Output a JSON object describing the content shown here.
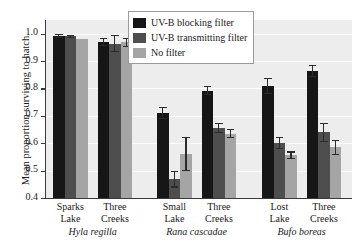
{
  "chart_data": {
    "type": "bar",
    "title": "",
    "xlabel": "",
    "ylabel": "Mean proportion surviving to hatch",
    "ylim": [
      0.4,
      1.05
    ],
    "yticks": [
      0.4,
      0.5,
      0.6,
      0.7,
      0.8,
      0.9,
      1.0
    ],
    "ytick_labels": [
      "0.4",
      "0.5",
      "0.6",
      "0.7",
      "0.8",
      "0.9",
      "1.0"
    ],
    "grid": true,
    "legend_position": "top-center",
    "categories": [
      "Sparks Lake",
      "Three Creeks",
      "Small Lake",
      "Three Creeks",
      "Lost Lake",
      "Three Creeks"
    ],
    "groups": [
      {
        "species": "Hyla regilla",
        "sites": [
          {
            "site_line1": "Sparks",
            "site_line2": "Lake",
            "bars": [
              {
                "series": "UV-B blocking filter",
                "value": 0.992,
                "err_low": 0.008,
                "err_high": 0.008
              },
              {
                "series": "UV-B transmitting filter",
                "value": 0.991,
                "err_low": 0.006,
                "err_high": 0.006
              },
              {
                "series": "No filter",
                "value": 0.982,
                "err_low": 0.0,
                "err_high": 0.0
              }
            ]
          },
          {
            "site_line1": "Three",
            "site_line2": "Creeks",
            "bars": [
              {
                "series": "UV-B blocking filter",
                "value": 0.97,
                "err_low": 0.014,
                "err_high": 0.014
              },
              {
                "series": "UV-B transmitting filter",
                "value": 0.964,
                "err_low": 0.03,
                "err_high": 0.03
              },
              {
                "series": "No filter",
                "value": 0.968,
                "err_low": 0.016,
                "err_high": 0.016
              }
            ]
          }
        ]
      },
      {
        "species": "Rana cascadae",
        "sites": [
          {
            "site_line1": "Small",
            "site_line2": "Lake",
            "bars": [
              {
                "series": "UV-B blocking filter",
                "value": 0.71,
                "err_low": 0.022,
                "err_high": 0.022
              },
              {
                "series": "UV-B transmitting filter",
                "value": 0.468,
                "err_low": 0.03,
                "err_high": 0.03
              },
              {
                "series": "No filter",
                "value": 0.56,
                "err_low": 0.062,
                "err_high": 0.062
              }
            ]
          },
          {
            "site_line1": "Three",
            "site_line2": "Creeks",
            "bars": [
              {
                "series": "UV-B blocking filter",
                "value": 0.792,
                "err_low": 0.016,
                "err_high": 0.016
              },
              {
                "series": "UV-B transmitting filter",
                "value": 0.656,
                "err_low": 0.018,
                "err_high": 0.018
              },
              {
                "series": "No filter",
                "value": 0.635,
                "err_low": 0.016,
                "err_high": 0.016
              }
            ]
          }
        ]
      },
      {
        "species": "Bufo boreas",
        "sites": [
          {
            "site_line1": "Lost",
            "site_line2": "Lake",
            "bars": [
              {
                "series": "UV-B blocking filter",
                "value": 0.81,
                "err_low": 0.03,
                "err_high": 0.03
              },
              {
                "series": "UV-B transmitting filter",
                "value": 0.6,
                "err_low": 0.022,
                "err_high": 0.022
              },
              {
                "series": "No filter",
                "value": 0.556,
                "err_low": 0.014,
                "err_high": 0.014
              }
            ]
          },
          {
            "site_line1": "Three",
            "site_line2": "Creeks",
            "bars": [
              {
                "series": "UV-B blocking filter",
                "value": 0.864,
                "err_low": 0.022,
                "err_high": 0.022
              },
              {
                "series": "UV-B transmitting filter",
                "value": 0.64,
                "err_low": 0.035,
                "err_high": 0.035
              },
              {
                "series": "No filter",
                "value": 0.585,
                "err_low": 0.028,
                "err_high": 0.028
              }
            ]
          }
        ]
      }
    ],
    "series": [
      {
        "name": "UV-B blocking filter",
        "color": "#161616",
        "values": [
          0.992,
          0.97,
          0.71,
          0.792,
          0.81,
          0.864
        ]
      },
      {
        "name": "UV-B transmitting filter",
        "color": "#4e4e4e",
        "values": [
          0.991,
          0.964,
          0.468,
          0.656,
          0.6,
          0.64
        ]
      },
      {
        "name": "No filter",
        "color": "#a5a5a5",
        "values": [
          0.982,
          0.968,
          0.56,
          0.635,
          0.556,
          0.585
        ]
      }
    ]
  },
  "legend": {
    "items": [
      {
        "label": "UV-B blocking filter",
        "color": "#161616"
      },
      {
        "label": "UV-B transmitting filter",
        "color": "#4e4e4e"
      },
      {
        "label": "No filter",
        "color": "#a5a5a5"
      }
    ]
  },
  "colors": {
    "plot_background": "#ededed",
    "gridline": "#fbfbfb",
    "axis": "#3a3a3a",
    "text": "#1a1a1a",
    "page_background": "#ffffff"
  }
}
